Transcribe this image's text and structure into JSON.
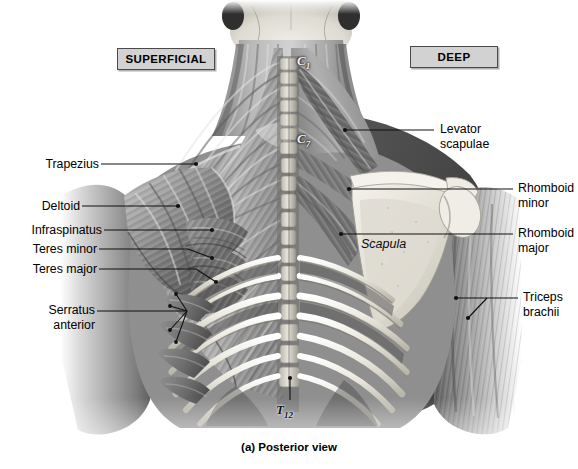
{
  "figure": {
    "caption": "(a) Posterior view"
  },
  "headers": [
    {
      "id": "superficial",
      "label": "SUPERFICIAL"
    },
    {
      "id": "deep",
      "label": "DEEP"
    }
  ],
  "labels_left": [
    {
      "id": "trapezius",
      "text": "Trapezius"
    },
    {
      "id": "deltoid",
      "text": "Deltoid"
    },
    {
      "id": "infraspinatus",
      "text": "Infraspinatus"
    },
    {
      "id": "teres-minor",
      "text": "Teres minor"
    },
    {
      "id": "teres-major",
      "text": "Teres major"
    },
    {
      "id": "serratus-anterior",
      "line1": "Serratus",
      "line2": "anterior"
    }
  ],
  "labels_right": [
    {
      "id": "levator-scapulae",
      "line1": "Levator",
      "line2": "scapulae"
    },
    {
      "id": "rhomboid-minor",
      "line1": "Rhomboid",
      "line2": "minor"
    },
    {
      "id": "rhomboid-major",
      "line1": "Rhomboid",
      "line2": "major"
    },
    {
      "id": "triceps-brachii",
      "line1": "Triceps",
      "line2": "brachii"
    }
  ],
  "bone_labels": [
    {
      "id": "scapula",
      "text": "Scapula"
    }
  ],
  "vertebrae": [
    {
      "id": "c1",
      "letter": "C",
      "number": "1"
    },
    {
      "id": "c7",
      "letter": "C",
      "number": "7"
    },
    {
      "id": "t12",
      "letter": "T",
      "number": "12"
    }
  ],
  "colors": {
    "background": "#ffffff",
    "box_fill": "#d2d2d2",
    "box_border": "#4a4a4a",
    "leader_line": "#111111",
    "muscle_mid": "#8d8d8d",
    "muscle_dark": "#4a4a4a",
    "bone_light": "#e8e6df",
    "skin_light": "#cfcfcf"
  }
}
